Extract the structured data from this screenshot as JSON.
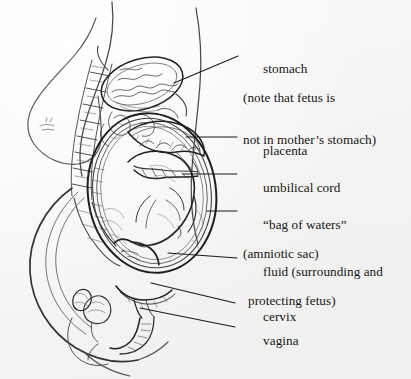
{
  "figure": {
    "kind": "anatomical-illustration",
    "style": "pen-and-ink line drawing on off-white paper",
    "ink_color": "#1a1a1a",
    "paper_color": "#f5f5f3"
  },
  "labels": [
    {
      "name": "stomach",
      "line1": "stomach",
      "line2": "(note that fetus is",
      "line3": "not in mother’s stomach)"
    },
    {
      "name": "placenta",
      "line1": "placenta"
    },
    {
      "name": "umbilical-cord",
      "line1": "umbilical cord"
    },
    {
      "name": "bag-of-waters",
      "line1": "“bag of waters”",
      "line2": "(amniotic sac)"
    },
    {
      "name": "fluid",
      "line1": "fluid (surrounding and",
      "line2": "protecting fetus)"
    },
    {
      "name": "cervix",
      "line1": "cervix"
    },
    {
      "name": "vagina",
      "line1": "vagina"
    }
  ],
  "anatomy_parts": [
    "body-outline",
    "breast",
    "spine",
    "stomach",
    "intestines",
    "uterus",
    "amniotic-sac",
    "placenta",
    "umbilical-cord",
    "fetus",
    "cervix",
    "vagina",
    "bladder",
    "pubic-bone",
    "sacrum"
  ]
}
